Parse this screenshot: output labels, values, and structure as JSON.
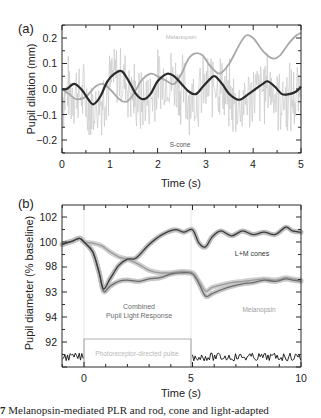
{
  "chart_data": [
    {
      "panel_label": "(a)",
      "type": "line",
      "title": "",
      "xlabel": "Time (s)",
      "ylabel": "Pupil dilation (mm)",
      "xlim": [
        0,
        5
      ],
      "ylim": [
        -0.25,
        0.25
      ],
      "xticks": [
        "0",
        "1",
        "2",
        "3",
        "4",
        "5"
      ],
      "yticks": [
        "0.2",
        "0.1",
        "0.0",
        "−0.1",
        "−0.2"
      ],
      "grid": false,
      "annotations": [
        "Melanopsin",
        "S-cone"
      ],
      "series": [
        {
          "name": "Melanopsin",
          "color": "#a8a8a8",
          "x": [
            0,
            0.15,
            0.3,
            0.5,
            0.7,
            0.85,
            1.0,
            1.2,
            1.35,
            1.5,
            1.65,
            1.85,
            2.0,
            2.2,
            2.35,
            2.5,
            2.65,
            2.8,
            2.95,
            3.1,
            3.3,
            3.5,
            3.7,
            3.85,
            4.0,
            4.2,
            4.4,
            4.55,
            4.75,
            4.9,
            5.0
          ],
          "y": [
            0.0,
            -0.02,
            -0.04,
            -0.03,
            0.01,
            0.02,
            0.0,
            -0.04,
            -0.05,
            -0.02,
            0.03,
            0.06,
            0.05,
            0.03,
            0.02,
            0.06,
            0.12,
            0.14,
            0.13,
            0.09,
            0.06,
            0.1,
            0.17,
            0.21,
            0.2,
            0.15,
            0.12,
            0.13,
            0.18,
            0.21,
            0.22
          ]
        },
        {
          "name": "S-cone",
          "color": "#2a2a2a",
          "x": [
            0,
            0.1,
            0.25,
            0.4,
            0.55,
            0.65,
            0.8,
            0.95,
            1.1,
            1.25,
            1.4,
            1.55,
            1.7,
            1.85,
            2.0,
            2.2,
            2.35,
            2.5,
            2.65,
            2.8,
            2.95,
            3.1,
            3.2,
            3.35,
            3.5,
            3.65,
            3.75,
            3.9,
            4.05,
            4.2,
            4.3,
            4.45,
            4.6,
            4.75,
            4.9,
            5.0
          ],
          "y": [
            0.0,
            0.0,
            0.02,
            0.0,
            -0.04,
            -0.06,
            -0.03,
            0.03,
            0.06,
            0.07,
            0.03,
            -0.02,
            -0.04,
            -0.02,
            0.03,
            0.06,
            0.05,
            0.02,
            -0.01,
            -0.02,
            0.01,
            0.04,
            0.05,
            0.02,
            -0.02,
            -0.04,
            -0.04,
            -0.02,
            0.0,
            0.02,
            0.03,
            0.01,
            -0.02,
            -0.02,
            -0.01,
            0.01
          ]
        },
        {
          "name": "S-cone (noisy raw)",
          "color": "#c4c4c4",
          "description": "high-frequency noisy trace oscillating roughly between -0.17 and 0.18 around the S-cone curve"
        }
      ]
    },
    {
      "panel_label": "(b)",
      "type": "line",
      "title": "",
      "xlabel": "Time (s)",
      "ylabel": "Pupil diameter (% baseline)",
      "xlim": [
        -1,
        10
      ],
      "ylim": [
        90.5,
        103
      ],
      "xticks": [
        "0",
        "5",
        "10"
      ],
      "yticks": [
        "102",
        "100",
        "98",
        "93",
        "94",
        "92"
      ],
      "grid": false,
      "annotations": [
        "L+M cones",
        "Combined Pupil Light Response",
        "Melanopsin",
        "Photoreceptor-directed pulse"
      ],
      "series": [
        {
          "name": "L+M cones",
          "color": "#3a3a3a",
          "x": [
            -1,
            -0.5,
            -0.2,
            0,
            0.4,
            0.7,
            0.9,
            1.2,
            1.6,
            2.0,
            2.4,
            3.0,
            3.6,
            4.2,
            4.6,
            5.0,
            5.3,
            5.6,
            5.9,
            6.3,
            6.8,
            7.3,
            7.8,
            8.3,
            8.8,
            9.3,
            9.6,
            10.0
          ],
          "y": [
            99.8,
            100.1,
            100.3,
            100.0,
            99.2,
            97.5,
            96.2,
            97.0,
            98.1,
            98.6,
            98.7,
            99.8,
            100.6,
            101.0,
            100.8,
            101.0,
            99.9,
            99.6,
            100.4,
            100.9,
            100.5,
            100.9,
            100.6,
            100.8,
            100.6,
            101.2,
            100.9,
            100.8
          ]
        },
        {
          "name": "Combined Pupil Light Response",
          "color": "#6a6a6a",
          "x": [
            -1,
            -0.5,
            -0.2,
            0,
            0.4,
            0.7,
            0.9,
            1.2,
            1.6,
            2.0,
            2.5,
            3.0,
            3.5,
            4.0,
            4.5,
            5.0,
            5.3,
            5.6,
            5.9,
            6.3,
            6.8,
            7.3,
            7.8,
            8.3,
            8.8,
            9.3,
            9.6,
            10.0
          ],
          "y": [
            99.8,
            100.1,
            100.3,
            100.0,
            99.2,
            97.5,
            96.0,
            96.4,
            96.8,
            96.9,
            96.8,
            97.0,
            97.1,
            97.4,
            97.5,
            97.4,
            96.6,
            95.6,
            95.8,
            96.1,
            96.4,
            96.6,
            96.7,
            96.9,
            96.8,
            97.0,
            96.9,
            96.8
          ]
        },
        {
          "name": "Melanopsin",
          "color": "#9a9a9a",
          "x": [
            -1,
            -0.5,
            -0.2,
            0,
            0.4,
            0.8,
            1.2,
            1.6,
            2.0,
            2.5,
            3.0,
            3.5,
            4.0,
            4.5,
            5.0,
            5.3,
            5.6,
            5.9,
            6.3,
            6.8,
            7.3,
            7.8,
            8.3,
            8.8,
            9.3,
            9.6,
            10.0
          ],
          "y": [
            99.8,
            100.1,
            100.3,
            100.0,
            99.9,
            99.7,
            99.2,
            98.8,
            98.6,
            98.2,
            97.7,
            97.5,
            97.5,
            97.6,
            97.5,
            96.8,
            96.0,
            96.3,
            96.5,
            96.7,
            96.8,
            96.9,
            97.0,
            96.9,
            97.1,
            97.0,
            96.9
          ]
        },
        {
          "name": "Photoreceptor-directed pulse",
          "color": "#b0b0b0",
          "type": "step",
          "x": [
            -1,
            0,
            0,
            5,
            5,
            10
          ],
          "y": [
            "off",
            "off",
            "on",
            "on",
            "off",
            "off"
          ]
        },
        {
          "name": "Baseline noise trace",
          "color": "#111111",
          "description": "noisy black trace near the bottom of the axes outside the pulse window (t<0 and t>5)"
        }
      ]
    }
  ],
  "panel_a": {
    "label": "(a)",
    "ylabel": "Pupil dilation (mm)",
    "xlabel": "Time (s)",
    "yticks": [
      "0.2",
      "0.1",
      "0.0",
      "−0.1",
      "−0.2"
    ],
    "xticks": [
      "0",
      "1",
      "2",
      "3",
      "4",
      "5"
    ],
    "annotation_melanopsin": "Melanopsin",
    "annotation_scone": "S-cone"
  },
  "panel_b": {
    "label": "(b)",
    "ylabel": "Pupil diameter (% baseline)",
    "xlabel": "Time (s)",
    "yticks": [
      "102",
      "100",
      "98",
      "93",
      "94",
      "92"
    ],
    "xticks": [
      "0",
      "5",
      "10"
    ],
    "annotation_lm": "L+M cones",
    "annotation_combined_1": "Combined",
    "annotation_combined_2": "Pupil Light Response",
    "annotation_melanopsin": "Melanopsin",
    "annotation_pulse": "Photoreceptor-directed pulse"
  },
  "caption": {
    "prefix": "7",
    "text": "Melanopsin-mediated PLR and rod, cone and light-adapted"
  },
  "colors": {
    "axis": "#2a2a2a",
    "dark_line": "#333333",
    "mid_line": "#6a6a6a",
    "light_line": "#a8a8a8",
    "noise": "#c8c8c8",
    "band": "#c9c9c9"
  }
}
